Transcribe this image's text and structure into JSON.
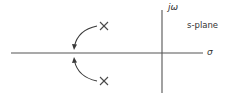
{
  "diagram": {
    "title": "s-plane",
    "type": "root-locus pole-plot",
    "axes": {
      "real_axis_label": "σ",
      "imaginary_axis_label": "jω"
    },
    "plane_label": "s-plane",
    "poles": [
      {
        "name": "upper-pole",
        "marker": "×",
        "position": "upper-left quadrant"
      },
      {
        "name": "lower-pole",
        "marker": "×",
        "position": "lower-left quadrant"
      }
    ],
    "arrows": [
      {
        "from": "upper-pole",
        "to": "real-axis",
        "direction": "curving down-left onto real axis"
      },
      {
        "from": "lower-pole",
        "to": "real-axis",
        "direction": "curving up-left onto real axis"
      }
    ],
    "colors": {
      "line": "#555555",
      "text": "#333333",
      "background": "#ffffff"
    }
  }
}
